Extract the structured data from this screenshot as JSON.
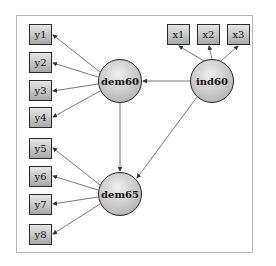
{
  "diagram": {
    "type": "structural-equation-model",
    "latent_variables": [
      {
        "id": "dem60",
        "label": "dem60"
      },
      {
        "id": "dem65",
        "label": "dem65"
      },
      {
        "id": "ind60",
        "label": "ind60"
      }
    ],
    "observed_variables": {
      "dem60": [
        "y1",
        "y2",
        "y3",
        "y4"
      ],
      "dem65": [
        "y5",
        "y6",
        "y7",
        "y8"
      ],
      "ind60": [
        "x1",
        "x2",
        "x3"
      ]
    },
    "paths": [
      {
        "from": "ind60",
        "to": "dem60"
      },
      {
        "from": "ind60",
        "to": "dem65"
      },
      {
        "from": "dem60",
        "to": "dem65"
      }
    ],
    "colors": {
      "node_fill_light": "#e6e6e6",
      "node_fill_dark": "#a9a9a9",
      "stroke": "#222222",
      "frame": "#b5b5b5"
    }
  }
}
